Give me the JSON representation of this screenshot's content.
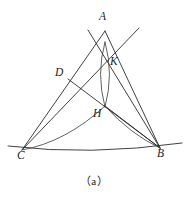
{
  "figure": {
    "caption": "（a）",
    "stroke_color": "#2b2b2b",
    "background_color": "#ffffff",
    "width": 188,
    "height": 197,
    "labels": [
      {
        "id": "A",
        "text": "A",
        "x": 99,
        "y": 11
      },
      {
        "id": "D",
        "text": "D",
        "x": 55,
        "y": 67
      },
      {
        "id": "K",
        "text": "K",
        "x": 110,
        "y": 56
      },
      {
        "id": "H",
        "text": "H",
        "x": 93,
        "y": 108
      },
      {
        "id": "C",
        "text": "C",
        "x": 17,
        "y": 150
      },
      {
        "id": "B",
        "text": "B",
        "x": 157,
        "y": 148
      }
    ],
    "points": {
      "A": {
        "x": 105,
        "y": 31
      },
      "B": {
        "x": 160,
        "y": 148
      },
      "C": {
        "x": 22,
        "y": 150
      },
      "D": {
        "x": 68,
        "y": 79
      },
      "H": {
        "x": 105,
        "y": 106
      },
      "K": {
        "x": 108,
        "y": 64
      },
      "X1": {
        "x": 96,
        "y": 42
      },
      "X2": {
        "x": 116,
        "y": 41
      }
    },
    "paths": {
      "baseline_CB": "M 8 146 Q 90 156 182 143",
      "line_C_to_upper_right": "M 22 150 L 139 28",
      "line_B_to_upper_left": "M 160 148 L 88 30",
      "line_A_to_C_side": "M 105 31 L 22 150",
      "line_A_to_B_side": "M 105 31 L 160 148",
      "segment_D_to_B": "M 68 79 L 160 148",
      "segment_H_to_B": "M 105 106 L 160 148",
      "arc_C_to_H": "M 22 150 Q 66 142 105 106",
      "arc_H_to_B": "M 105 106 Q 130 134 160 148",
      "lens_left_arc": "M 105 42 Q 96 74 105 107",
      "lens_right_arc": "M 105 42 Q 114 74 105 107"
    }
  }
}
